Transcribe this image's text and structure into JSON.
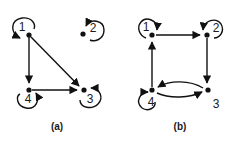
{
  "figure": {
    "panels": [
      {
        "caption": "(a)",
        "nodes": [
          {
            "id": "1",
            "label": "1",
            "self_loop": true
          },
          {
            "id": "2",
            "label": "2",
            "self_loop": true
          },
          {
            "id": "3",
            "label": "3",
            "self_loop": true
          },
          {
            "id": "4",
            "label": "4",
            "self_loop": true
          }
        ],
        "edges": [
          {
            "from": "1",
            "to": "4"
          },
          {
            "from": "1",
            "to": "3"
          },
          {
            "from": "4",
            "to": "3"
          }
        ]
      },
      {
        "caption": "(b)",
        "nodes": [
          {
            "id": "1",
            "label": "1",
            "self_loop": true
          },
          {
            "id": "2",
            "label": "2",
            "self_loop": true
          },
          {
            "id": "3",
            "label": "3",
            "self_loop": false
          },
          {
            "id": "4",
            "label": "4",
            "self_loop": true
          }
        ],
        "edges": [
          {
            "from": "1",
            "to": "2"
          },
          {
            "from": "2",
            "to": "3"
          },
          {
            "from": "3",
            "to": "4"
          },
          {
            "from": "4",
            "to": "3"
          },
          {
            "from": "4",
            "to": "1"
          }
        ]
      }
    ],
    "colors": {
      "ink": "#111111",
      "background": "#ffffff"
    }
  }
}
